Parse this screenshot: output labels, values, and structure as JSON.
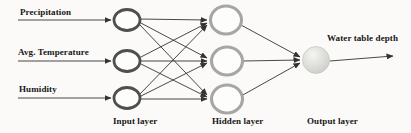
{
  "diagram": {
    "input_labels": [
      "Precipitation",
      "Avg. Temperature",
      "Humidity"
    ],
    "output_label": "Water table depth",
    "layer_labels": {
      "input": "Input layer",
      "hidden": "Hidden layer",
      "output": "Output layer"
    },
    "node_counts": {
      "input": 3,
      "hidden": 3,
      "output": 1
    },
    "colors": {
      "background": "#fbfaf8",
      "edge": "#333333",
      "text": "#161616",
      "input_node_border": "#4f4f4f",
      "hidden_node_border": "#a6a6a6",
      "node_fill": "#fdfdfc",
      "output_node_highlight": "#f5f5f3",
      "output_node_shade": "#c9c9c4",
      "output_node_border": "#bdbdb8"
    }
  }
}
